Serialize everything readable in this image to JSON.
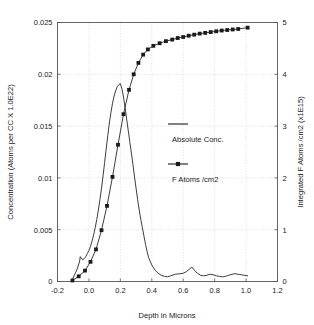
{
  "chart_data": {
    "type": "line",
    "title": "",
    "xlabel": "Depth in Microns",
    "ylabel": "Concentration (Atoms per CC X 1.0E22)",
    "y2label": "Integrated F Atoms /cm2 (x1E15)",
    "xlim": [
      -0.2,
      1.2
    ],
    "ylim": [
      0,
      0.025
    ],
    "y2lim": [
      0,
      5
    ],
    "grid": true,
    "legend_position": "center-right-inside",
    "xticks": [
      "-0.2",
      "0.0",
      "0.2",
      "0.4",
      "0.6",
      "0.8",
      "1.0",
      "1.2"
    ],
    "xtick_values": [
      -0.2,
      0.0,
      0.2,
      0.4,
      0.6,
      0.8,
      1.0,
      1.2
    ],
    "yticks": [
      "0",
      "0.005",
      "0.01",
      "0.015",
      "0.02",
      "0.025"
    ],
    "ytick_values": [
      0,
      0.005,
      0.01,
      0.015,
      0.02,
      0.025
    ],
    "y2ticks": [
      "0",
      "1",
      "2",
      "3",
      "4",
      "5"
    ],
    "y2tick_values": [
      0,
      1,
      2,
      3,
      4,
      5
    ],
    "series": [
      {
        "name": "Absolute Conc.",
        "axis": "left",
        "marker": "none",
        "color": "#1a1a1a",
        "x": [
          -0.105,
          -0.09,
          -0.075,
          -0.06,
          -0.055,
          -0.04,
          -0.03,
          -0.02,
          -0.01,
          0.0,
          0.01,
          0.02,
          0.03,
          0.04,
          0.05,
          0.06,
          0.07,
          0.08,
          0.09,
          0.1,
          0.11,
          0.12,
          0.13,
          0.14,
          0.15,
          0.16,
          0.17,
          0.18,
          0.19,
          0.2,
          0.21,
          0.22,
          0.23,
          0.24,
          0.25,
          0.26,
          0.27,
          0.28,
          0.29,
          0.3,
          0.31,
          0.32,
          0.33,
          0.34,
          0.35,
          0.36,
          0.37,
          0.38,
          0.4,
          0.42,
          0.44,
          0.46,
          0.48,
          0.5,
          0.52,
          0.55,
          0.58,
          0.6,
          0.62,
          0.64,
          0.655,
          0.67,
          0.69,
          0.71,
          0.73,
          0.75,
          0.77,
          0.79,
          0.81,
          0.83,
          0.85,
          0.87,
          0.89,
          0.91,
          0.93,
          0.95,
          0.97,
          0.99,
          1.01
        ],
        "y": [
          0.0002,
          0.0007,
          0.0012,
          0.0019,
          0.0024,
          0.0021,
          0.0022,
          0.0024,
          0.0027,
          0.003,
          0.0034,
          0.0039,
          0.0045,
          0.0052,
          0.006,
          0.0069,
          0.0079,
          0.009,
          0.0102,
          0.0115,
          0.0128,
          0.0141,
          0.0153,
          0.0163,
          0.0172,
          0.0179,
          0.0184,
          0.0188,
          0.019,
          0.0191,
          0.0186,
          0.0178,
          0.0168,
          0.0157,
          0.0146,
          0.0135,
          0.0124,
          0.0113,
          0.0101,
          0.009,
          0.0079,
          0.0069,
          0.006,
          0.0052,
          0.0044,
          0.0036,
          0.0029,
          0.0023,
          0.0016,
          0.0011,
          0.0008,
          0.0006,
          0.0005,
          0.00045,
          0.00055,
          0.0007,
          0.00075,
          0.0008,
          0.00095,
          0.0012,
          0.0014,
          0.0011,
          0.0008,
          0.0006,
          0.00055,
          0.0006,
          0.0007,
          0.00065,
          0.00055,
          0.0005,
          0.00045,
          0.0005,
          0.0006,
          0.0007,
          0.00075,
          0.0007,
          0.00065,
          0.0006,
          0.00055
        ]
      },
      {
        "name": "F Atoms /cm2",
        "axis": "right",
        "marker": "square",
        "color": "#1a1a1a",
        "x": [
          -0.105,
          -0.065,
          -0.025,
          0.01,
          0.045,
          0.08,
          0.115,
          0.15,
          0.185,
          0.22,
          0.255,
          0.285,
          0.315,
          0.345,
          0.375,
          0.41,
          0.45,
          0.49,
          0.53,
          0.565,
          0.6,
          0.635,
          0.67,
          0.705,
          0.74,
          0.775,
          0.81,
          0.845,
          0.88,
          0.915,
          0.95,
          1.01
        ],
        "y": [
          0.02,
          0.1,
          0.21,
          0.38,
          0.62,
          0.99,
          1.46,
          2.02,
          2.64,
          3.23,
          3.7,
          4.0,
          4.22,
          4.38,
          4.48,
          4.55,
          4.6,
          4.64,
          4.67,
          4.7,
          4.72,
          4.745,
          4.765,
          4.785,
          4.8,
          4.815,
          4.83,
          4.845,
          4.855,
          4.865,
          4.875,
          4.9
        ]
      }
    ],
    "legend": [
      {
        "label": "Absolute Conc.",
        "key": "line"
      },
      {
        "label": "F Atoms /cm2",
        "key": "line-square-marker"
      }
    ]
  },
  "colors": {
    "line": "#1a1a1a",
    "grid": "#c9c9c9",
    "frame": "#555555",
    "background": "#ffffff"
  }
}
